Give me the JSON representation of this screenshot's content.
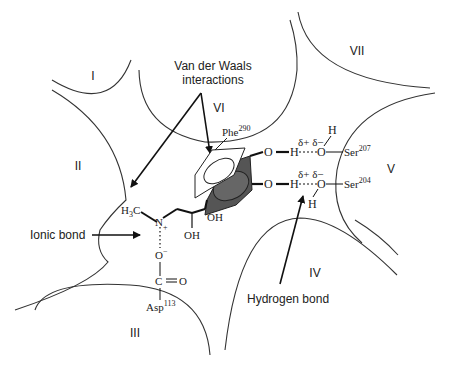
{
  "diagram": {
    "regions": [
      "I",
      "II",
      "III",
      "IV",
      "V",
      "VI",
      "VII"
    ],
    "labels": {
      "vdw_line1": "Van der Waals",
      "vdw_line2": "interactions",
      "ionic": "Ionic bond",
      "hbond": "Hydrogen bond"
    },
    "residues": {
      "phe": "Phe",
      "phe_num": "290",
      "ser207": "Ser",
      "ser207_num": "207",
      "ser204": "Ser",
      "ser204_num": "204",
      "asp": "Asp",
      "asp_num": "113"
    },
    "atoms": {
      "h3c": "H",
      "h3c_sub": "3",
      "h3c_c": "C",
      "n": "N",
      "nplus": "+",
      "o_minus": "O",
      "minus": "−",
      "c": "C",
      "o_dbl": "O",
      "oh1": "OH",
      "oh2": "OH",
      "o_top": "O",
      "h_top": "H",
      "o_bot": "O",
      "h_bot": "H",
      "ser_o_top": "O",
      "ser_h_top": "H",
      "ser_o_bot": "O",
      "ser_h_bot": "H",
      "delta_top": "δ+ δ−",
      "delta_bot": "δ+ δ−"
    }
  }
}
